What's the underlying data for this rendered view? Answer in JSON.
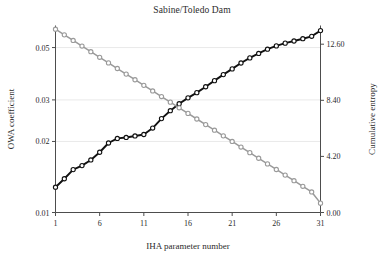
{
  "chart_data": {
    "type": "line",
    "title": "Sabine/Toledo Dam",
    "xlabel": "IHA parameter number",
    "ylabel": "OWA coefficient",
    "y2label": "Cumulative entropy",
    "grid": true,
    "legend": "none",
    "xlim": [
      1,
      31
    ],
    "xticks": [
      "1",
      "6",
      "11",
      "16",
      "21",
      "26",
      "31"
    ],
    "xtick_values": [
      1,
      6,
      11,
      16,
      21,
      26,
      31
    ],
    "yscale": "log",
    "ylim": [
      0.01,
      0.062
    ],
    "yticks": [
      "0.01",
      "0.02",
      "0.03",
      "0.05"
    ],
    "ytick_values": [
      0.01,
      0.02,
      0.03,
      0.05
    ],
    "y2scale": "linear",
    "y2lim": [
      0.0,
      14.0
    ],
    "y2ticks": [
      "0.00",
      "4.20",
      "8.40",
      "12.60"
    ],
    "y2tick_values": [
      0.0,
      4.2,
      8.4,
      12.6
    ],
    "x": [
      1,
      2,
      3,
      4,
      5,
      6,
      7,
      8,
      9,
      10,
      11,
      12,
      13,
      14,
      15,
      16,
      17,
      18,
      19,
      20,
      21,
      22,
      23,
      24,
      25,
      26,
      27,
      28,
      29,
      30,
      31
    ],
    "series": [
      {
        "name": "OWA coefficient",
        "axis": "left",
        "color": "#111111",
        "marker": "circle",
        "values": [
          0.0128,
          0.0139,
          0.0152,
          0.0158,
          0.0167,
          0.018,
          0.0197,
          0.0206,
          0.0208,
          0.0211,
          0.0214,
          0.0228,
          0.025,
          0.027,
          0.0289,
          0.0306,
          0.0322,
          0.0341,
          0.0362,
          0.0384,
          0.0406,
          0.043,
          0.0452,
          0.0472,
          0.0492,
          0.0508,
          0.0522,
          0.0533,
          0.0545,
          0.0558,
          0.059
        ]
      },
      {
        "name": "Cumulative entropy",
        "axis": "right",
        "color": "#9a9a9a",
        "marker": "circle",
        "values": [
          13.72,
          13.3,
          12.88,
          12.46,
          12.04,
          11.62,
          11.2,
          10.78,
          10.36,
          9.94,
          9.52,
          9.1,
          8.68,
          8.26,
          7.84,
          7.42,
          7.0,
          6.58,
          6.16,
          5.74,
          5.32,
          4.9,
          4.48,
          4.06,
          3.64,
          3.22,
          2.8,
          2.38,
          1.96,
          1.54,
          0.7
        ]
      }
    ]
  },
  "figure": {
    "title_text": "Sabine/Toledo Dam",
    "x_axis_title": "IHA parameter number",
    "y_axis_title": "OWA coefficient",
    "y2_axis_title": "Cumulative entropy"
  }
}
